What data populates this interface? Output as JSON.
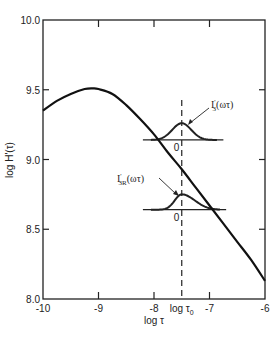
{
  "chart_data": {
    "type": "line",
    "title": "",
    "xlabel": "log τ",
    "ylabel": "log H'(τ)",
    "xlim": [
      -10,
      -6
    ],
    "ylim": [
      8.0,
      10.0
    ],
    "grid": false,
    "legend": null,
    "x_ticks": [
      {
        "value": -10,
        "label": "-10"
      },
      {
        "value": -9,
        "label": "-9"
      },
      {
        "value": -8,
        "label": "-8"
      },
      {
        "value": -7.5,
        "label": "log τ0"
      },
      {
        "value": -7,
        "label": "-7"
      },
      {
        "value": -6,
        "label": "-6"
      }
    ],
    "y_ticks": [
      {
        "value": 10.0,
        "label": "10.0"
      },
      {
        "value": 9.5,
        "label": "9.5"
      },
      {
        "value": 9.0,
        "label": "9.0"
      },
      {
        "value": 8.5,
        "label": "8.5"
      },
      {
        "value": 8.0,
        "label": "8.0"
      }
    ],
    "series": [
      {
        "name": "log H'(τ)",
        "x": [
          -10.0,
          -9.75,
          -9.5,
          -9.25,
          -9.1,
          -9.0,
          -8.75,
          -8.5,
          -8.25,
          -8.0,
          -7.75,
          -7.5,
          -7.25,
          -7.0,
          -6.75,
          -6.5,
          -6.25,
          -6.0
        ],
        "y": [
          9.35,
          9.42,
          9.47,
          9.505,
          9.51,
          9.505,
          9.47,
          9.39,
          9.29,
          9.18,
          9.05,
          8.93,
          8.8,
          8.67,
          8.54,
          8.41,
          8.28,
          8.13
        ]
      }
    ],
    "reference_lines": [
      {
        "type": "vertical",
        "style": "dashed",
        "x": -7.5,
        "label": "log τ0"
      }
    ],
    "annotations": [
      {
        "text": "I'3(ωτ)",
        "shape": "symmetric bell curve centered at log τ0",
        "baseline_y": 9.14,
        "peak_y": 9.26,
        "x_range": [
          -8.2,
          -6.75
        ],
        "zero_label": "0"
      },
      {
        "text": "I'3R(ωτ)",
        "shape": "asymmetric bell curve (sharp left rise, long right tail) centered at log τ0",
        "baseline_y": 8.64,
        "peak_y": 8.75,
        "x_range": [
          -8.2,
          -6.7
        ],
        "zero_label": "0"
      }
    ]
  },
  "labels": {
    "xlabel_main": "log τ",
    "ylabel": "log H'(τ)",
    "tau0_label": "log τ",
    "tau0_sub": "0",
    "ann_upper_main": "I",
    "ann_upper_sup": "'",
    "ann_upper_sub": "3",
    "ann_upper_arg": "(ωτ)",
    "ann_lower_main": "I",
    "ann_lower_sup": "'",
    "ann_lower_sub": "3R",
    "ann_lower_arg": "(ωτ)",
    "zero": "0"
  }
}
